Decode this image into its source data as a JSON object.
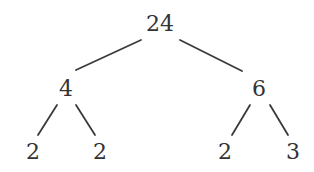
{
  "diagram": {
    "type": "factor-tree",
    "root": "24",
    "nodes": [
      {
        "id": "n24",
        "label": "24",
        "x": 160,
        "y": 24
      },
      {
        "id": "n4",
        "label": "4",
        "x": 66,
        "y": 89
      },
      {
        "id": "n6",
        "label": "6",
        "x": 259,
        "y": 89
      },
      {
        "id": "n2a",
        "label": "2",
        "x": 33,
        "y": 152
      },
      {
        "id": "n2b",
        "label": "2",
        "x": 100,
        "y": 152
      },
      {
        "id": "n2c",
        "label": "2",
        "x": 225,
        "y": 152
      },
      {
        "id": "n3",
        "label": "3",
        "x": 293,
        "y": 152
      }
    ],
    "edges": [
      {
        "from": "n24",
        "to": "n4",
        "x1": 141,
        "y1": 40,
        "x2": 76,
        "y2": 70
      },
      {
        "from": "n24",
        "to": "n6",
        "x1": 180,
        "y1": 40,
        "x2": 242,
        "y2": 71
      },
      {
        "from": "n4",
        "to": "n2a",
        "x1": 57,
        "y1": 105,
        "x2": 38,
        "y2": 135
      },
      {
        "from": "n4",
        "to": "n2b",
        "x1": 76,
        "y1": 105,
        "x2": 95,
        "y2": 135
      },
      {
        "from": "n6",
        "to": "n2c",
        "x1": 250,
        "y1": 105,
        "x2": 232,
        "y2": 135
      },
      {
        "from": "n6",
        "to": "n3",
        "x1": 270,
        "y1": 105,
        "x2": 288,
        "y2": 135
      }
    ],
    "colors": {
      "text": "#333333",
      "line": "#3a3a3a",
      "background": "#ffffff"
    }
  }
}
